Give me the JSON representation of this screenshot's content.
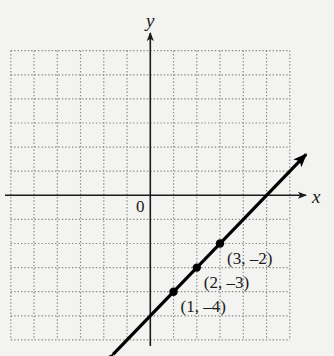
{
  "chart_data": {
    "type": "line",
    "title": "",
    "xlabel": "x",
    "ylabel": "y",
    "origin_label": "0",
    "xlim": [
      -6,
      6
    ],
    "ylim": [
      -6,
      6
    ],
    "grid": true,
    "grid_style": "dotted",
    "legend": null,
    "series": [
      {
        "name": "y = x - 5",
        "slope": 1,
        "intercept": -5,
        "arrows_both_ends": true,
        "x_range": [
          -1.6,
          6.7
        ],
        "points": [
          {
            "x": 1,
            "y": -4,
            "label": "(1, –4)"
          },
          {
            "x": 2,
            "y": -3,
            "label": "(2, –3)"
          },
          {
            "x": 3,
            "y": -2,
            "label": "(3, –2)"
          }
        ]
      }
    ]
  },
  "colors": {
    "background": "#f3f3f1",
    "grid": "#8a8a8a",
    "axis": "#1a1a1a",
    "line": "#000000"
  }
}
